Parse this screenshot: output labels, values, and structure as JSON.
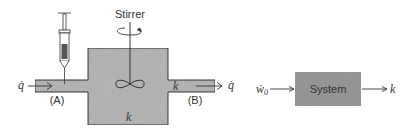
{
  "left_diagram": {
    "stirrer_label": "Stirrer",
    "inlet_flow_label": "q̇",
    "outlet_flow_label": "q̇",
    "point_a_label": "(A)",
    "point_b_label": "(B)",
    "tank_k_label": "k",
    "outlet_pipe_k_label": "k",
    "icons": [
      "syringe-icon",
      "stirrer-shaft-icon",
      "rotation-arrow-icon",
      "impeller-icon"
    ]
  },
  "right_diagram": {
    "input_label": "ẇ",
    "input_subscript": "0",
    "system_label": "System",
    "output_label": "k"
  },
  "colors": {
    "fluid_fill": "#b9b9b9",
    "system_box_fill": "#9a9a9a",
    "stroke": "#333333"
  }
}
